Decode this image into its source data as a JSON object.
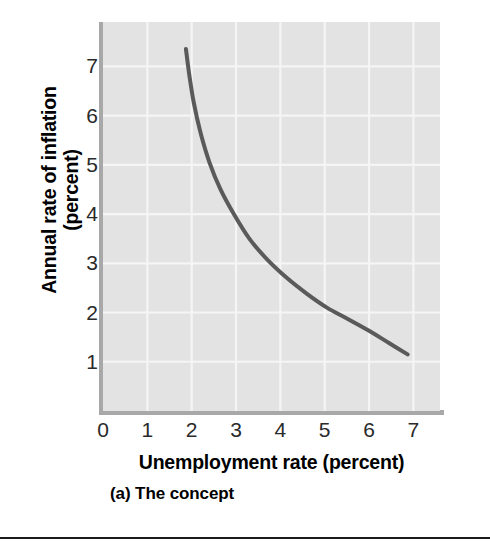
{
  "figure": {
    "caption": "(a) The concept",
    "colors": {
      "plot_background": "#e3e3e3",
      "gridline": "#f5f5f5",
      "axis_line": "#a8a8a8",
      "curve": "#5a5a5a",
      "tick_label": "#2a2a2a",
      "title_text": "#000000",
      "divider": "#1a1a1a",
      "page_background": "#ffffff"
    }
  },
  "chart_data": {
    "type": "line",
    "title": "",
    "subtitle": "",
    "xlabel": "Unemployment rate (percent)",
    "ylabel_lines": [
      "Annual rate of inflation",
      "(percent)"
    ],
    "ylabel": "Annual rate of inflation (percent)",
    "xlim": [
      0,
      7.6
    ],
    "ylim": [
      0,
      7.9
    ],
    "xticks": [
      0,
      1,
      2,
      3,
      4,
      5,
      6,
      7
    ],
    "xticklabels": [
      "0",
      "1",
      "2",
      "3",
      "4",
      "5",
      "6",
      "7"
    ],
    "yticks": [
      1,
      2,
      3,
      4,
      5,
      6,
      7
    ],
    "yticklabels": [
      "1",
      "2",
      "3",
      "4",
      "5",
      "6",
      "7"
    ],
    "grid": true,
    "grid_color": "#f5f5f5",
    "legend": false,
    "legend_position": "none",
    "annotations": [],
    "series": [
      {
        "name": "Phillips curve",
        "color": "#5a5a5a",
        "line_width": 4,
        "x": [
          1.87,
          1.95,
          2.05,
          2.2,
          2.4,
          2.65,
          2.95,
          3.3,
          3.7,
          4.15,
          4.6,
          5.05,
          5.5,
          6.0,
          6.45,
          6.87
        ],
        "y": [
          7.35,
          6.8,
          6.25,
          5.65,
          5.05,
          4.5,
          4.0,
          3.5,
          3.08,
          2.7,
          2.38,
          2.1,
          1.88,
          1.63,
          1.38,
          1.15
        ]
      }
    ]
  }
}
